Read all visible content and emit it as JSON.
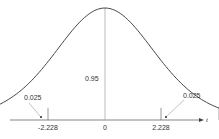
{
  "chart_data": {
    "type": "area",
    "title": "",
    "xlabel": "t",
    "ylabel": "",
    "x_ticks": [
      "-2.228",
      "0",
      "2.228"
    ],
    "x_tick_values": [
      -2.228,
      0,
      2.228
    ],
    "xlim": [
      -3.6,
      3.6
    ],
    "grid": false,
    "legend": null,
    "center_area_label": "0.95",
    "tails": [
      {
        "side": "left",
        "bound": -2.228,
        "area": 0.025,
        "label": "0.025",
        "shaded": true
      },
      {
        "side": "right",
        "bound": 2.228,
        "area": 0.025,
        "label": "0.025",
        "shaded": true
      }
    ],
    "series": [
      {
        "name": "t density (df=10)",
        "df": 10
      }
    ],
    "colors": {
      "curve": "#333333",
      "shade": "#c8c8c8",
      "axis": "#666666",
      "center_line": "#aaaaaa",
      "text": "#333333"
    }
  },
  "labels": {
    "center_area": "0.95",
    "left_tail": "0.025",
    "right_tail": "0.025",
    "tick_left": "-2.228",
    "tick_center": "0",
    "tick_right": "2.228",
    "axis_var": "t"
  }
}
